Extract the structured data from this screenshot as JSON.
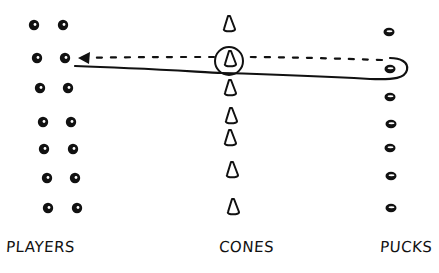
{
  "diagram": {
    "type": "hockey-drill-sketch",
    "style": "hand-drawn ink on white",
    "colors": {
      "ink": "#111111",
      "background": "#ffffff",
      "highlight": "#ffffff"
    },
    "labels": {
      "players": "PLAYERS",
      "cones": "CONES",
      "pucks": "PUCKS"
    },
    "players": {
      "columns": 2,
      "rows": 7,
      "positions": [
        [
          [
            34,
            25
          ],
          [
            63,
            25
          ]
        ],
        [
          [
            37,
            58
          ],
          [
            65,
            58
          ]
        ],
        [
          [
            40,
            88
          ],
          [
            68,
            88
          ]
        ],
        [
          [
            43,
            122
          ],
          [
            71,
            122
          ]
        ],
        [
          [
            44,
            149
          ],
          [
            73,
            149
          ]
        ],
        [
          [
            47,
            178
          ],
          [
            75,
            178
          ]
        ],
        [
          [
            48,
            208
          ],
          [
            77,
            208
          ]
        ]
      ],
      "active_player": [
        65,
        58
      ]
    },
    "cones": {
      "count": 7,
      "positions": [
        [
          229,
          25
        ],
        [
          230,
          60
        ],
        [
          230,
          89
        ],
        [
          231,
          117
        ],
        [
          230,
          139
        ],
        [
          232,
          171
        ],
        [
          233,
          208
        ]
      ],
      "circled_index": 1
    },
    "pucks": {
      "count": 7,
      "positions": [
        [
          389,
          32
        ],
        [
          390,
          69
        ],
        [
          390,
          97
        ],
        [
          391,
          124
        ],
        [
          390,
          148
        ],
        [
          391,
          176
        ],
        [
          391,
          208
        ]
      ],
      "target_index": 1
    },
    "paths": [
      {
        "kind": "solid",
        "description": "skate path from player through circled cone around puck",
        "from": "player-row-2",
        "via": "cone-2",
        "to": "puck-2"
      },
      {
        "kind": "dashed-arrow",
        "description": "return pass from puck to player",
        "from": "puck-2",
        "to": "player-row-2"
      }
    ]
  }
}
